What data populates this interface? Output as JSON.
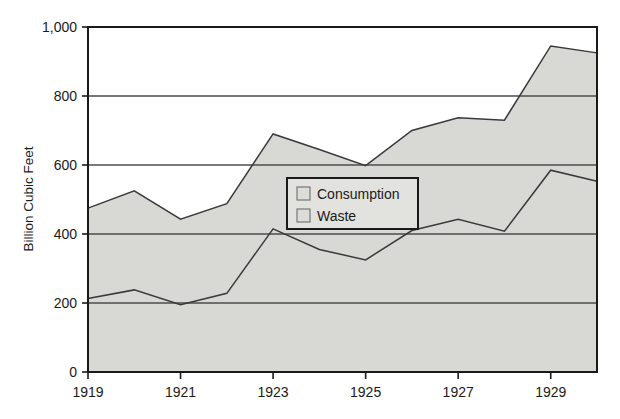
{
  "chart_data": {
    "type": "area",
    "title": "",
    "subtitle": "",
    "xlabel": "",
    "ylabel": "Billion Cubic Feet",
    "stacked": true,
    "grid": true,
    "grid_axis": "y",
    "legend_position": "inside-center",
    "xlim": [
      1919,
      1930
    ],
    "ylim": [
      0,
      1000
    ],
    "yticks": [
      0,
      200,
      400,
      600,
      800,
      1000
    ],
    "ytick_labels": [
      "0",
      "200",
      "400",
      "600",
      "800",
      "1,000"
    ],
    "xticks": [
      1919,
      1921,
      1923,
      1925,
      1927,
      1929
    ],
    "xtick_labels": [
      "1919",
      "1921",
      "1923",
      "1925",
      "1927",
      "1929"
    ],
    "x": [
      1919,
      1920,
      1921,
      1922,
      1923,
      1924,
      1925,
      1926,
      1927,
      1928,
      1929,
      1930
    ],
    "series": [
      {
        "name": "Consumption",
        "color": "#d6d6d2",
        "values": [
          213,
          238,
          195,
          228,
          415,
          355,
          325,
          410,
          443,
          408,
          585,
          553
        ]
      },
      {
        "name": "Waste",
        "color": "#d9d9d5",
        "values": [
          262,
          287,
          248,
          260,
          275,
          290,
          273,
          290,
          294,
          322,
          360,
          372
        ]
      }
    ],
    "cumulative_totals": [
      475,
      525,
      443,
      488,
      690,
      645,
      598,
      700,
      737,
      730,
      945,
      925
    ],
    "legend": [
      {
        "label": "Consumption",
        "swatch_color": "#dcdcd8"
      },
      {
        "label": "Waste",
        "swatch_color": "#dcdcd8"
      }
    ],
    "colors": {
      "plot_background": "#ffffff",
      "area_fill": "#d8d8d4",
      "grid_line": "#4d4d4d",
      "axis_line": "#1a1a1a",
      "series_line": "#3a3a3a",
      "text": "#1a1a1a",
      "legend_background": "#e2e2de",
      "legend_border": "#1a1a1a"
    }
  }
}
